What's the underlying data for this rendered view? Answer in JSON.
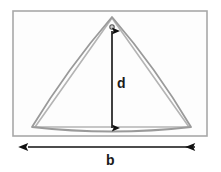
{
  "figure": {
    "type": "geometry-diagram",
    "background_color": "#ffffff",
    "frame": {
      "name": "rectangular-frame",
      "stroke_color": "#a8a8a8",
      "stroke_width": 1.6,
      "fill_color": "#fdfdfd",
      "x": 13,
      "y": 11,
      "width": 194,
      "height": 125
    },
    "shape": {
      "name": "bowed-triangle-outline",
      "stroke_color": "#9a9a9a",
      "inner_stroke_color": "#b4b4b4",
      "stroke_width": 1.7,
      "apex": {
        "x": 112,
        "y": 17
      },
      "base_left": {
        "x": 32,
        "y": 127
      },
      "base_right": {
        "x": 191,
        "y": 127
      },
      "bow_sagitta": 5
    },
    "depth_arrow": {
      "name": "depth-dimension-arrow",
      "orientation": "vertical",
      "double_headed": true,
      "color": "#111111",
      "stroke_width": 1.6,
      "x": 112,
      "y_top": 30,
      "y_bottom": 129,
      "label": "d"
    },
    "apex_marker": {
      "name": "apex-point-marker",
      "color": "#555555",
      "x": 112,
      "y": 27,
      "radius": 2.2
    },
    "base_arrow": {
      "name": "base-dimension-arrow",
      "orientation": "horizontal",
      "double_headed": true,
      "color": "#111111",
      "stroke_width": 1.6,
      "y": 147,
      "x_left": 27,
      "x_right": 196,
      "label": "b"
    }
  }
}
